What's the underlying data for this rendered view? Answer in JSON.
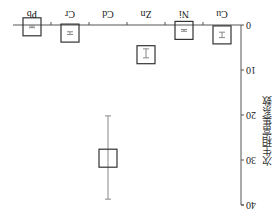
{
  "chart_data": {
    "type": "box",
    "orientation_note": "figure rendered rotated 180 degrees",
    "title": "",
    "xlabel": "",
    "ylabel": "次生相富集系数",
    "ylim": [
      0,
      40
    ],
    "yticks": [
      0,
      10,
      20,
      30,
      40
    ],
    "grid": false,
    "legend": null,
    "categories": [
      "Cu",
      "Ni",
      "Zn",
      "Cd",
      "Cr",
      "Pb"
    ],
    "series": [
      {
        "name": "次生相富集系数",
        "mean": [
          2.2,
          1.2,
          6.6,
          29.6,
          1.8,
          0.4
        ],
        "box_low": [
          0.2,
          -0.8,
          4.6,
          27.6,
          -0.2,
          -1.6
        ],
        "box_high": [
          4.2,
          3.2,
          8.6,
          31.6,
          3.8,
          2.4
        ],
        "whisker_low": [
          1.6,
          1.0,
          5.3,
          20.2,
          1.5,
          0.2
        ],
        "whisker_high": [
          2.8,
          1.4,
          7.3,
          38.7,
          2.1,
          0.6
        ]
      }
    ],
    "colors": {
      "axis": "#555555",
      "box": "#333333",
      "whisker": "#888888"
    }
  }
}
